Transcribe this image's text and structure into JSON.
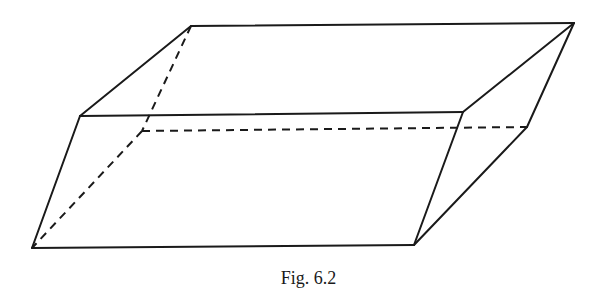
{
  "figure": {
    "caption": "Fig. 6.2",
    "vertices": {
      "top_back_left": [
        191,
        26
      ],
      "top_back_right": [
        574,
        23
      ],
      "top_front_left": [
        80,
        116
      ],
      "top_front_right": [
        463,
        112
      ],
      "bottom_back_left": [
        142,
        131
      ],
      "bottom_back_right": [
        527,
        127
      ],
      "bottom_front_left": [
        32,
        248
      ],
      "bottom_front_right": [
        414,
        245
      ]
    },
    "visible_edges": [
      [
        "top_back_left",
        "top_back_right"
      ],
      [
        "top_back_left",
        "top_front_left"
      ],
      [
        "top_back_right",
        "top_front_right"
      ],
      [
        "top_front_left",
        "top_front_right"
      ],
      [
        "top_back_right",
        "bottom_back_right"
      ],
      [
        "top_front_left",
        "bottom_front_left"
      ],
      [
        "top_front_right",
        "bottom_front_right"
      ],
      [
        "bottom_front_left",
        "bottom_front_right"
      ],
      [
        "bottom_front_right",
        "bottom_back_right"
      ]
    ],
    "hidden_edges": [
      [
        "top_back_left",
        "bottom_back_left"
      ],
      [
        "bottom_back_left",
        "bottom_back_right"
      ],
      [
        "bottom_back_left",
        "bottom_front_left"
      ]
    ],
    "line_color": "#1a1a1a"
  }
}
